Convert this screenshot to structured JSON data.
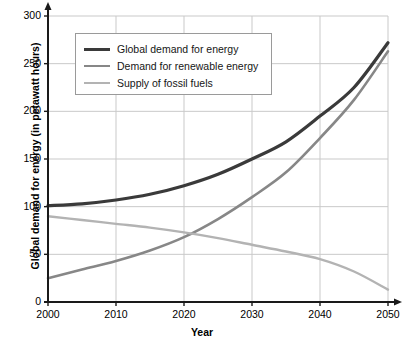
{
  "chart_data": {
    "type": "line",
    "title": "",
    "xlabel": "Year",
    "ylabel": "Global demand for energy (in petawatt hours)",
    "xlim": [
      2000,
      2050
    ],
    "ylim": [
      0,
      300
    ],
    "x_ticks": [
      "2000",
      "2010",
      "2020",
      "2030",
      "2040",
      "2050"
    ],
    "y_ticks": [
      "0",
      "50",
      "100",
      "150",
      "200",
      "250",
      "300"
    ],
    "grid": true,
    "legend_position": "upper-left",
    "x": [
      2000,
      2005,
      2010,
      2015,
      2020,
      2025,
      2030,
      2035,
      2040,
      2045,
      2050
    ],
    "series": [
      {
        "name": "Global demand for energy",
        "color": "#3a3a3a",
        "values": [
          101,
          103,
          107,
          113,
          122,
          134,
          150,
          168,
          195,
          225,
          272
        ]
      },
      {
        "name": "Demand for renewable energy",
        "color": "#878787",
        "values": [
          25,
          34,
          43,
          54,
          68,
          87,
          110,
          136,
          172,
          212,
          263
        ]
      },
      {
        "name": "Supply of fossil fuels",
        "color": "#b3b3b3",
        "values": [
          90,
          86,
          82,
          78,
          73,
          67,
          60,
          53,
          45,
          32,
          13
        ]
      }
    ]
  },
  "legend": {
    "items": [
      {
        "label": "Global demand for energy",
        "color": "#3a3a3a",
        "width": 3.2
      },
      {
        "label": "Demand for renewable energy",
        "color": "#878787",
        "width": 2.6
      },
      {
        "label": "Supply of fossil fuels",
        "color": "#b3b3b3",
        "width": 2.4
      }
    ]
  },
  "axes": {
    "x_title": "Year",
    "y_title": "Global demand for energy (in petawatt hours)",
    "x_tick_labels": [
      "2000",
      "2010",
      "2020",
      "2030",
      "2040",
      "2050"
    ],
    "y_tick_labels": [
      "300",
      "250",
      "200",
      "150",
      "100",
      "50",
      "0"
    ]
  },
  "colors": {
    "grid": "#c9c9c9",
    "axis": "#1a1a1a",
    "background": "#ffffff"
  }
}
